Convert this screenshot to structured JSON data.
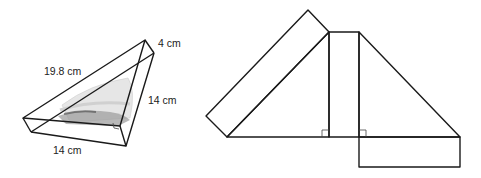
{
  "figure": {
    "prism": {
      "description": "Triangular prism sandwich container",
      "labels": {
        "height": "4 cm",
        "hypotenuse": "19.8 cm",
        "right_leg": "14 cm",
        "bottom_leg": "14 cm"
      }
    },
    "net": {
      "description": "Net of the triangular prism: two right triangles and three rectangles",
      "right_angle_markers": 2
    }
  }
}
